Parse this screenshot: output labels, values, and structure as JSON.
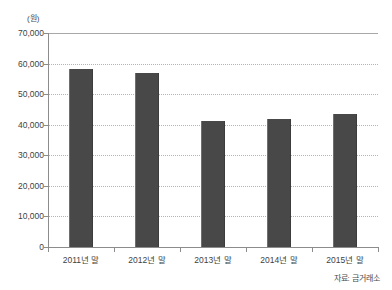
{
  "chart_data": {
    "type": "bar",
    "title": "",
    "subtitle": "",
    "unit_label": "(원)",
    "xlabel": "",
    "ylabel": "",
    "categories": [
      "2011년 말",
      "2012년 말",
      "2013년 말",
      "2014년 말",
      "2015년 말"
    ],
    "values": [
      58200,
      56900,
      41200,
      41800,
      43500
    ],
    "ylim": [
      0,
      70000
    ],
    "ytick_step": 10000,
    "ytick_labels": [
      "70,000",
      "60,000",
      "50,000",
      "40,000",
      "30,000",
      "20,000",
      "10,000",
      "0"
    ],
    "ytick_values": [
      70000,
      60000,
      50000,
      40000,
      30000,
      20000,
      10000,
      0
    ],
    "grid": true,
    "grid_axis": "y",
    "legend": false,
    "legend_position": "none",
    "source_note": "자료: 금거래소",
    "bar_color": "#484848",
    "grid_color": "#b4b4b4",
    "axis_color": "#8c8c8c",
    "background_color": "#ffffff"
  }
}
